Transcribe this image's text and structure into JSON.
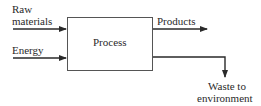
{
  "diagram": {
    "inputs": [
      {
        "label_line1": "Raw",
        "label_line2": "materials"
      },
      {
        "label": "Energy"
      }
    ],
    "process": {
      "label": "Process"
    },
    "outputs": [
      {
        "label": "Products"
      },
      {
        "label_line1": "Waste to",
        "label_line2": "environment"
      }
    ]
  }
}
